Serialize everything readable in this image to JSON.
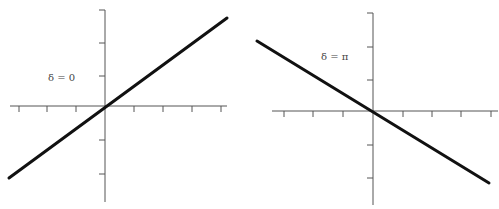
{
  "panels": [
    {
      "label": "δ = 0",
      "origin": [
        105,
        106
      ],
      "x_axis": {
        "from": 10,
        "to": 227,
        "ticks": [
          19,
          47,
          76,
          134,
          163,
          192,
          221
        ]
      },
      "y_axis": {
        "from": 10,
        "to": 202,
        "ticks": [
          10,
          43,
          76,
          140,
          174
        ]
      },
      "line": {
        "x1": 9,
        "y1": 178,
        "x2": 227,
        "y2": 18
      },
      "label_pos": [
        48,
        81
      ]
    },
    {
      "label": "δ = π",
      "origin": [
        373,
        111
      ],
      "x_axis": {
        "from": 272,
        "to": 498,
        "ticks": [
          284,
          313,
          343,
          403,
          432,
          461,
          491
        ]
      },
      "y_axis": {
        "from": 13,
        "to": 205,
        "ticks": [
          13,
          47,
          80,
          145,
          178
        ]
      },
      "line": {
        "x1": 257,
        "y1": 41,
        "x2": 489,
        "y2": 183
      },
      "label_pos": [
        321,
        60
      ]
    }
  ],
  "colors": {
    "axis": "#555555",
    "trace": "#111111",
    "label": "#444444"
  }
}
